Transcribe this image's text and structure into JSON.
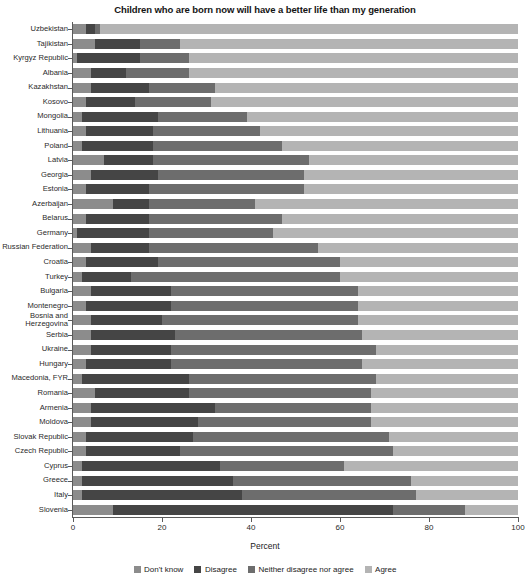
{
  "chart_data": {
    "type": "bar",
    "subtype": "horizontal-stacked-100",
    "title": "Children who are born now will have a better life than my generation",
    "xlabel": "Percent",
    "ylabel": "",
    "xlim": [
      0,
      100
    ],
    "xticks": [
      0,
      20,
      40,
      60,
      80,
      100
    ],
    "grid": false,
    "legend_position": "bottom",
    "categories": [
      "Uzbekistan",
      "Tajikistan",
      "Kyrgyz Republic",
      "Albania",
      "Kazakhstan",
      "Kosovo",
      "Mongolia",
      "Lithuania",
      "Poland",
      "Latvia",
      "Georgia",
      "Estonia",
      "Azerbaijan",
      "Belarus",
      "Germany",
      "Russian Federation",
      "Croatia",
      "Turkey",
      "Bulgaria",
      "Montenegro",
      "Bosnia and Herzegovina",
      "Serbia",
      "Ukraine",
      "Hungary",
      "Macedonia, FYR",
      "Romania",
      "Armenia",
      "Moldova",
      "Slovak Republic",
      "Czech Republic",
      "Cyprus",
      "Greece",
      "Italy",
      "Slovenia"
    ],
    "series": [
      {
        "name": "Don't know",
        "color": "#8c8c8c",
        "values": [
          3,
          5,
          1,
          4,
          4,
          3,
          2,
          3,
          2,
          7,
          4,
          3,
          9,
          3,
          1,
          4,
          3,
          2,
          4,
          3,
          4,
          4,
          4,
          3,
          2,
          5,
          4,
          4,
          3,
          3,
          2,
          2,
          2,
          9
        ]
      },
      {
        "name": "Disagree",
        "color": "#454545",
        "values": [
          2,
          10,
          14,
          8,
          13,
          11,
          17,
          15,
          16,
          11,
          15,
          14,
          8,
          14,
          16,
          13,
          16,
          11,
          18,
          19,
          16,
          19,
          18,
          19,
          24,
          21,
          28,
          24,
          24,
          21,
          31,
          34,
          36,
          63
        ]
      },
      {
        "name": "Neither disagree nor agree",
        "color": "#6d6d6d",
        "values": [
          1,
          9,
          11,
          14,
          15,
          17,
          20,
          24,
          29,
          35,
          33,
          35,
          24,
          30,
          28,
          38,
          41,
          47,
          42,
          42,
          44,
          42,
          46,
          43,
          42,
          41,
          35,
          39,
          44,
          48,
          28,
          40,
          39,
          16
        ]
      },
      {
        "name": "Agree",
        "color": "#b4b4b4",
        "values": [
          94,
          76,
          74,
          74,
          68,
          69,
          61,
          58,
          53,
          47,
          48,
          48,
          59,
          53,
          55,
          45,
          40,
          40,
          36,
          36,
          36,
          35,
          32,
          35,
          32,
          33,
          33,
          33,
          29,
          28,
          39,
          24,
          23,
          12
        ]
      }
    ]
  },
  "legend": {
    "items": [
      {
        "label": "Don't know",
        "color": "#8c8c8c"
      },
      {
        "label": "Disagree",
        "color": "#454545"
      },
      {
        "label": "Neither disagree nor agree",
        "color": "#6d6d6d"
      },
      {
        "label": "Agree",
        "color": "#b4b4b4"
      }
    ]
  }
}
